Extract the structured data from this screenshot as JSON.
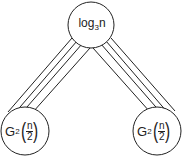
{
  "diagram": {
    "top_node": {
      "label_base": "log",
      "label_sub": "3",
      "label_tail": "n"
    },
    "left_node": {
      "label_base": "G",
      "label_sub": "2",
      "frac_num": "n",
      "frac_den": "2"
    },
    "right_node": {
      "label_base": "G",
      "label_sub": "2",
      "frac_num": "n",
      "frac_den": "2"
    },
    "edges": [
      {
        "from": "top_node",
        "to": "left_node",
        "parallel_lines": 4
      },
      {
        "from": "top_node",
        "to": "right_node",
        "parallel_lines": 4
      }
    ],
    "caption": "",
    "stroke_color": "#222222"
  }
}
